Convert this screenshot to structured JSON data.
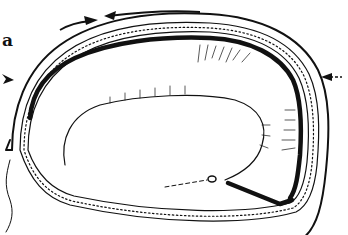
{
  "figure": {
    "panel_label": "a",
    "colors": {
      "background": "#ffffff",
      "ink": "#111111"
    },
    "elements": [
      {
        "name": "outer-boundary-line",
        "type": "curve"
      },
      {
        "name": "double-walled-band",
        "type": "dotted-band"
      },
      {
        "name": "thick-inner-wall",
        "type": "thick-curve"
      },
      {
        "name": "inner-cavity-outline",
        "type": "curve"
      },
      {
        "name": "radial-hatching",
        "type": "tick-marks"
      },
      {
        "name": "bottom-probe-line",
        "type": "thick-line"
      },
      {
        "name": "dashed-lead-line",
        "type": "dashed-line"
      },
      {
        "name": "left-trailing-filament",
        "type": "curve"
      }
    ],
    "arrows": [
      {
        "name": "arrow-top-right-pointing",
        "direction": "right",
        "position": "top"
      },
      {
        "name": "arrow-top-left-pointing",
        "direction": "left",
        "position": "top"
      },
      {
        "name": "arrow-left-pointing-right",
        "direction": "right",
        "position": "left"
      },
      {
        "name": "arrow-right-pointing-left",
        "direction": "left",
        "position": "right"
      }
    ]
  }
}
